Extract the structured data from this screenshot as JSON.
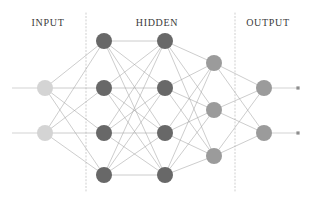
{
  "diagram": {
    "background_color": "#ffffff",
    "width": 311,
    "height": 201,
    "labels": [
      {
        "text": "INPUT",
        "x": 48,
        "y": 17
      },
      {
        "text": "HIDDEN",
        "x": 157,
        "y": 17
      },
      {
        "text": "OUTPUT",
        "x": 268,
        "y": 17
      }
    ],
    "label_color": "#3a3a3a",
    "dividers": [
      {
        "name": "input-hidden-divider",
        "x": 86,
        "y1": 13,
        "y2": 192
      },
      {
        "name": "hidden-output-divider",
        "x": 235,
        "y1": 13,
        "y2": 192
      }
    ],
    "divider_color": "#c9c9c9",
    "edge_color": "#a3a3a3",
    "arrow_color": "#b5b5b5",
    "layers": [
      {
        "name": "input-layer",
        "role": "input",
        "node_color": "#d4d4d4",
        "node_radius": 8,
        "x": 45,
        "nodes": [
          {
            "id": "i1",
            "y": 88
          },
          {
            "id": "i2",
            "y": 133
          }
        ]
      },
      {
        "name": "hidden-layer-1",
        "role": "hidden",
        "node_color": "#686868",
        "node_radius": 8,
        "x": 104,
        "nodes": [
          {
            "id": "h1-1",
            "y": 41
          },
          {
            "id": "h1-2",
            "y": 88
          },
          {
            "id": "h1-3",
            "y": 133
          },
          {
            "id": "h1-4",
            "y": 175
          }
        ]
      },
      {
        "name": "hidden-layer-2",
        "role": "hidden",
        "node_color": "#686868",
        "node_radius": 8,
        "x": 165,
        "nodes": [
          {
            "id": "h2-1",
            "y": 41
          },
          {
            "id": "h2-2",
            "y": 88
          },
          {
            "id": "h2-3",
            "y": 133
          },
          {
            "id": "h2-4",
            "y": 175
          }
        ]
      },
      {
        "name": "hidden-layer-3",
        "role": "hidden",
        "node_color": "#9b9b9b",
        "node_radius": 8,
        "x": 214,
        "nodes": [
          {
            "id": "h3-1",
            "y": 63
          },
          {
            "id": "h3-2",
            "y": 110
          },
          {
            "id": "h3-3",
            "y": 156
          }
        ]
      },
      {
        "name": "output-layer",
        "role": "output",
        "node_color": "#9b9b9b",
        "node_radius": 8,
        "x": 264,
        "nodes": [
          {
            "id": "o1",
            "y": 88
          },
          {
            "id": "o2",
            "y": 133
          }
        ]
      }
    ],
    "input_arrows": [
      {
        "name": "input-arrow-1",
        "x1": 12,
        "y1": 88,
        "x2": 45,
        "y2": 88
      },
      {
        "name": "input-arrow-2",
        "x1": 12,
        "y1": 133,
        "x2": 45,
        "y2": 133
      }
    ],
    "output_arrows": [
      {
        "name": "output-arrow-1",
        "x1": 264,
        "y1": 88,
        "x2": 298,
        "y2": 88
      },
      {
        "name": "output-arrow-2",
        "x1": 264,
        "y1": 133,
        "x2": 298,
        "y2": 133
      }
    ]
  }
}
